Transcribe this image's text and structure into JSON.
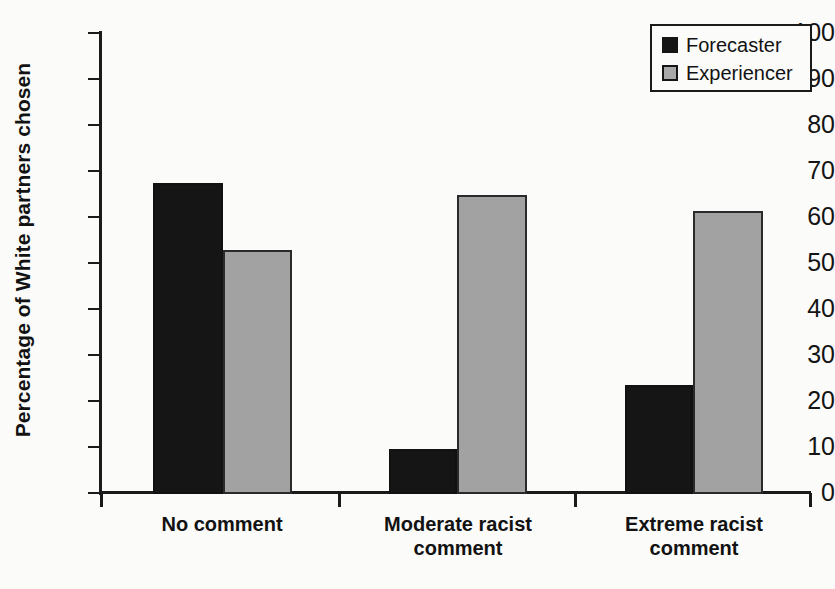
{
  "chart_data": {
    "type": "bar",
    "title": "",
    "xlabel": "",
    "ylabel": "Percentage of White partners chosen",
    "categories": [
      "No comment",
      "Moderate racist\ncomment",
      "Extreme racist\ncomment"
    ],
    "category_labels": [
      {
        "line1": "No comment",
        "line2": ""
      },
      {
        "line1": "Moderate racist",
        "line2": "comment"
      },
      {
        "line1": "Extreme racist",
        "line2": "comment"
      }
    ],
    "series": [
      {
        "name": "Forecaster",
        "color": "#151515",
        "values": [
          67.5,
          9.5,
          23.5
        ]
      },
      {
        "name": "Experiencer",
        "color": "#a2a2a2",
        "values": [
          52.8,
          64.8,
          61.3
        ]
      }
    ],
    "ylim": [
      0,
      100
    ],
    "ytick_step": 10,
    "ytick_labels": [
      "100",
      "90",
      "80",
      "70",
      "60",
      "50",
      "40",
      "30",
      "20",
      "10",
      "0"
    ],
    "grid": false,
    "legend_position": "top-right"
  },
  "legend": {
    "entries": [
      {
        "label": "Forecaster",
        "swatch": "black-square-icon"
      },
      {
        "label": "Experiencer",
        "swatch": "gray-square-icon"
      }
    ]
  },
  "axes": {
    "y_title": "Percentage of White partners chosen"
  }
}
